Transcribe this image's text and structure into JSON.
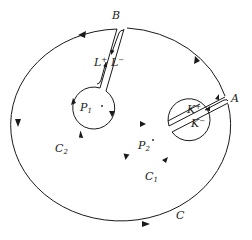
{
  "diagram": {
    "colors": {
      "stroke": "#1a1a1a",
      "background": "#ffffff"
    },
    "labels": {
      "A": "A",
      "B": "B",
      "C": "C",
      "C1": "C",
      "C1_sub": "1",
      "C2": "C",
      "C2_sub": "2",
      "P1": "P",
      "P1_sub": "1",
      "P2": "P",
      "P2_sub": "2",
      "K_plus": "K",
      "K_plus_sup": "+",
      "K_minus": "K",
      "K_minus_sup": "−",
      "L_plus": "L",
      "L_plus_sup": "+",
      "L_minus": "L",
      "L_minus_sup": "−"
    },
    "nodes": [
      {
        "id": "C",
        "type": "outer-contour",
        "direction": "counter-clockwise"
      },
      {
        "id": "C1",
        "type": "small-circle-around-P2",
        "direction": "clockwise"
      },
      {
        "id": "C2",
        "type": "small-circle-around-P1",
        "direction": "clockwise"
      },
      {
        "id": "K+",
        "type": "cut-path",
        "from": "C1",
        "to": "A"
      },
      {
        "id": "K-",
        "type": "cut-path",
        "from": "A",
        "to": "C1"
      },
      {
        "id": "L+",
        "type": "cut-path",
        "from": "C2",
        "to": "B"
      },
      {
        "id": "L-",
        "type": "cut-path",
        "from": "B",
        "to": "C2"
      }
    ]
  }
}
